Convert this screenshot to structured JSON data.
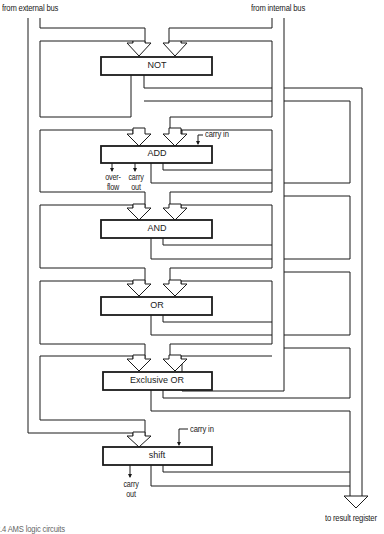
{
  "diagram": {
    "inputs": {
      "external_bus": "from external bus",
      "internal_bus": "from internal bus"
    },
    "output": "to result register",
    "blocks": [
      {
        "id": "not",
        "label": "NOT"
      },
      {
        "id": "add",
        "label": "ADD",
        "carry_in": "carry in",
        "overflow": "over-\nflow",
        "overflow_l1": "over-",
        "overflow_l2": "flow",
        "carry_out_l1": "carry",
        "carry_out_l2": "out"
      },
      {
        "id": "and",
        "label": "AND"
      },
      {
        "id": "or",
        "label": "OR"
      },
      {
        "id": "xor",
        "label": "Exclusive OR"
      },
      {
        "id": "shift",
        "label": "shift",
        "carry_in": "carry in",
        "carry_out_l1": "carry",
        "carry_out_l2": "out"
      }
    ],
    "caption": "2.4 AMS logic circuits"
  }
}
